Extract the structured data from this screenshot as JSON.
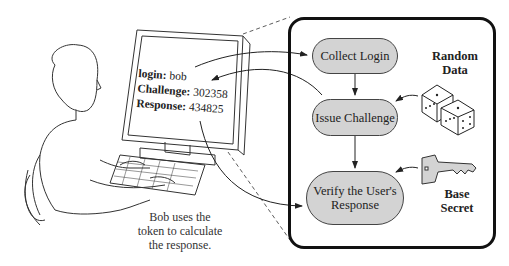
{
  "screen": {
    "login_label": "login:",
    "login_value": "bob",
    "challenge_label": "Challenge:",
    "challenge_value": "302358",
    "response_label": "Response:",
    "response_value": "434825"
  },
  "caption": {
    "line1": "Bob uses the",
    "line2": "token to calculate",
    "line3": "the response."
  },
  "flow": {
    "nodes": [
      {
        "label": "Collect Login"
      },
      {
        "label": "Issue Challenge"
      },
      {
        "label_line1": "Verify the User's",
        "label_line2": "Response"
      }
    ],
    "fill_color": "#d3d3d3"
  },
  "inputs": {
    "random": {
      "line1": "Random",
      "line2": "Data",
      "icon": "dice-icon"
    },
    "secret": {
      "line1": "Base",
      "line2": "Secret",
      "icon": "key-icon"
    }
  }
}
